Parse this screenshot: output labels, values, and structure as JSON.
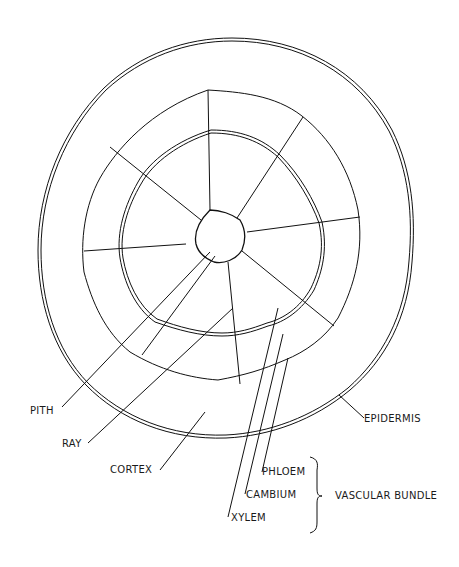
{
  "labels": {
    "pith": "PITH",
    "ray": "RAY",
    "cortex": "CORTEX",
    "epidermis": "EPIDERMIS",
    "phloem": "PHLOEM",
    "cambium": "CAMBIUM",
    "xylem": "XYLEM",
    "vascular_bundle": "VASCULAR BUNDLE"
  },
  "vascular_bundle_count": 8,
  "colors": {
    "ink": "#111111",
    "paper": "#ffffff"
  }
}
